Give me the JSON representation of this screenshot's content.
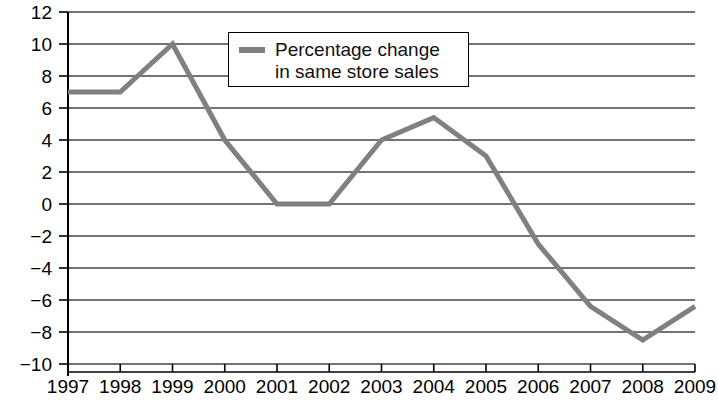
{
  "chart_data": {
    "type": "line",
    "title": "",
    "subtitle": "",
    "xlabel": "",
    "ylabel": "",
    "categories": [
      "1997",
      "1998",
      "1999",
      "2000",
      "2001",
      "2002",
      "2003",
      "2004",
      "2005",
      "2006",
      "2007",
      "2008",
      "2009"
    ],
    "x": [
      1997,
      1998,
      1999,
      2000,
      2001,
      2002,
      2003,
      2004,
      2005,
      2006,
      2007,
      2008,
      2009
    ],
    "series": [
      {
        "name": "Percentage change in same store sales",
        "values": [
          7,
          7,
          10,
          4,
          0,
          0,
          4,
          5.4,
          3,
          -2.5,
          -6.4,
          -8.5,
          -6.4
        ],
        "color": "#808080"
      }
    ],
    "ylim": [
      -10,
      12
    ],
    "xlim": [
      1997,
      2009
    ],
    "ytick_values": [
      12,
      10,
      8,
      6,
      4,
      2,
      0,
      -2,
      -4,
      -6,
      -8,
      -10
    ],
    "ytick_labels": [
      "12",
      "10",
      "8",
      "6",
      "4",
      "2",
      "0",
      "−2",
      "−4",
      "−6",
      "−8",
      "−10"
    ],
    "xtick_labels": [
      "1997",
      "1998",
      "1999",
      "2000",
      "2001",
      "2002",
      "2003",
      "2004",
      "2005",
      "2006",
      "2007",
      "2008",
      "2009"
    ],
    "grid": "horizontal",
    "grid_color": "#444444",
    "axis_color": "#000000",
    "legend_position": "top-center",
    "legend": [
      {
        "label": "Percentage change\nin same store sales",
        "color": "#808080",
        "marker": "line"
      }
    ]
  }
}
